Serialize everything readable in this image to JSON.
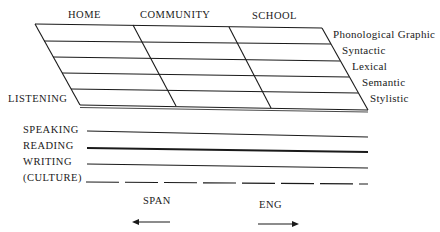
{
  "diagram": {
    "columns": [
      "HOME",
      "COMMUNITY",
      "SCHOOL"
    ],
    "levels": [
      "Phonological Graphic",
      "Syntactic",
      "Lexical",
      "Semantic",
      "Stylistic"
    ],
    "grid_corner_label": "LISTENING",
    "skills": [
      "SPEAKING",
      "READING",
      "WRITING",
      "(CULTURE)"
    ],
    "direction_left": "SPAN",
    "direction_right": "ENG",
    "colors": {
      "ink": "#1a1a1a",
      "background": "#ffffff"
    }
  }
}
